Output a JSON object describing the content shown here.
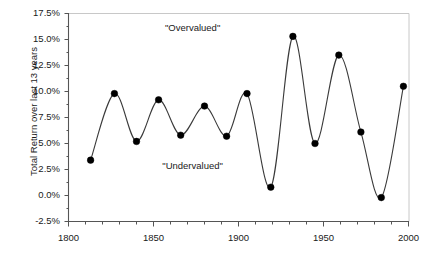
{
  "chart_data": {
    "type": "line",
    "title": "",
    "xlabel": "",
    "ylabel": "Total Return over last 13 years",
    "xlim": [
      1800,
      2000
    ],
    "ylim": [
      -2.5,
      17.5
    ],
    "grid": false,
    "legend": null,
    "x_tick_labels": [
      "1800",
      "1850",
      "1900",
      "1950",
      "2000"
    ],
    "x_tick_values": [
      1800,
      1850,
      1900,
      1950,
      2000
    ],
    "y_tick_labels": [
      "17.5%",
      "15.0%",
      "12.5%",
      "10.0%",
      "7.5%",
      "5.0%",
      "2.5%",
      "0.0%",
      "-2.5%"
    ],
    "y_tick_values": [
      17.5,
      15.0,
      12.5,
      10.0,
      7.5,
      5.0,
      2.5,
      0.0,
      -2.5
    ],
    "y_minor_tick_values": [
      16.25,
      13.75,
      11.25,
      8.75,
      6.25,
      3.75,
      1.25,
      -1.25
    ],
    "x_minor_tick_values": [
      1810,
      1820,
      1830,
      1840,
      1860,
      1870,
      1880,
      1890,
      1910,
      1920,
      1930,
      1940,
      1960,
      1970,
      1980,
      1990
    ],
    "series": [
      {
        "name": "Total Return over last 13 years",
        "marker": "filled-circle",
        "marker_color": "#000000",
        "line_color": "#3a3a3a",
        "x": [
          1813,
          1827,
          1840,
          1853,
          1866,
          1880,
          1893,
          1905,
          1919,
          1932,
          1945,
          1959,
          1972,
          1984,
          1997
        ],
        "values": [
          3.4,
          9.8,
          5.2,
          9.2,
          5.8,
          8.6,
          5.7,
          9.8,
          0.8,
          15.3,
          5.0,
          13.5,
          6.1,
          -0.2,
          10.5
        ]
      }
    ],
    "annotations": [
      {
        "text": "\"Overvalued\"",
        "x": 1873,
        "y": 16.0
      },
      {
        "text": "\"Undervalued\"",
        "x": 1873,
        "y": 2.7
      }
    ]
  },
  "axis": {
    "y_title": "Total Return over last 13 years"
  },
  "colors": {
    "marker": "#000000",
    "line": "#3a3a3a",
    "axis": "#555555",
    "frame": "#c8c8c8",
    "text": "#1a1a1a",
    "background": "#ffffff"
  }
}
